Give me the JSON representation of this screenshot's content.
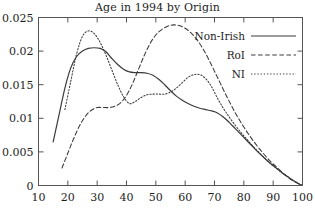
{
  "chart_data": {
    "type": "line",
    "title": "Age in 1994 by Origin",
    "xlabel": "",
    "ylabel": "",
    "xlim": [
      10,
      100
    ],
    "ylim": [
      0,
      0.025
    ],
    "grid": false,
    "legend_position": "top-right",
    "xticks": [
      10,
      20,
      30,
      40,
      50,
      60,
      70,
      80,
      90,
      100
    ],
    "xtick_labels": [
      "10",
      "20",
      "30",
      "40",
      "50",
      "60",
      "70",
      "80",
      "90",
      "100"
    ],
    "yticks": [
      0,
      0.005,
      0.01,
      0.015,
      0.02,
      0.025
    ],
    "ytick_labels": [
      "0",
      "0.005",
      "0.01",
      "0.015",
      "0.02",
      "0.025"
    ],
    "series": [
      {
        "name": "Non-Irish",
        "style": "solid",
        "color": "#3a3a3a",
        "x": [
          15,
          17,
          19,
          21,
          23,
          25,
          27,
          29,
          31,
          33,
          35,
          37,
          39,
          41,
          43,
          45,
          47,
          49,
          51,
          53,
          55,
          57,
          59,
          61,
          63,
          65,
          67,
          69,
          71,
          73,
          75,
          77,
          79,
          81,
          83,
          85,
          87,
          89,
          91,
          93,
          95,
          97,
          99,
          100
        ],
        "y": [
          0.0065,
          0.0105,
          0.0145,
          0.0175,
          0.0192,
          0.02,
          0.0204,
          0.0205,
          0.0204,
          0.0199,
          0.0189,
          0.018,
          0.0173,
          0.0169,
          0.0168,
          0.0168,
          0.0167,
          0.0164,
          0.0158,
          0.015,
          0.0141,
          0.0133,
          0.0127,
          0.0122,
          0.0118,
          0.0115,
          0.0113,
          0.0111,
          0.0108,
          0.0102,
          0.0094,
          0.0085,
          0.0076,
          0.0067,
          0.0058,
          0.0049,
          0.0041,
          0.0033,
          0.0026,
          0.0019,
          0.0013,
          0.0007,
          0.0002,
          0.0
        ]
      },
      {
        "name": "RoI",
        "style": "dashed",
        "color": "#3a3a3a",
        "x": [
          18,
          20,
          22,
          24,
          26,
          28,
          30,
          32,
          34,
          36,
          38,
          40,
          42,
          44,
          46,
          48,
          50,
          52,
          54,
          56,
          58,
          60,
          62,
          64,
          66,
          68,
          70,
          72,
          74,
          76,
          78,
          80,
          82,
          84,
          86,
          88,
          90,
          92,
          94,
          96,
          98,
          100
        ],
        "y": [
          0.0026,
          0.0048,
          0.007,
          0.0089,
          0.0103,
          0.0112,
          0.0116,
          0.0116,
          0.0116,
          0.0118,
          0.0123,
          0.0134,
          0.0151,
          0.0172,
          0.0193,
          0.0211,
          0.0224,
          0.0232,
          0.0237,
          0.0239,
          0.0238,
          0.0234,
          0.0227,
          0.0217,
          0.0204,
          0.0188,
          0.017,
          0.0152,
          0.0134,
          0.0117,
          0.0101,
          0.0087,
          0.0074,
          0.0062,
          0.0051,
          0.0041,
          0.0032,
          0.0024,
          0.0016,
          0.0009,
          0.0004,
          0.0
        ]
      },
      {
        "name": "NI",
        "style": "dotted",
        "color": "#3a3a3a",
        "x": [
          19,
          21,
          23,
          25,
          27,
          29,
          31,
          33,
          35,
          37,
          39,
          41,
          43,
          45,
          47,
          49,
          51,
          53,
          55,
          57,
          59,
          61,
          63,
          65,
          67,
          69,
          71,
          73,
          75,
          77,
          79,
          81,
          83,
          85,
          87,
          89,
          91,
          93,
          95,
          97,
          99,
          100
        ],
        "y": [
          0.0113,
          0.0155,
          0.0196,
          0.0222,
          0.023,
          0.0226,
          0.0213,
          0.0194,
          0.0172,
          0.015,
          0.0132,
          0.0122,
          0.0125,
          0.0131,
          0.0135,
          0.0136,
          0.0136,
          0.0136,
          0.0139,
          0.0145,
          0.0153,
          0.0161,
          0.0165,
          0.0165,
          0.0159,
          0.0147,
          0.013,
          0.0115,
          0.0102,
          0.009,
          0.0079,
          0.0069,
          0.0059,
          0.005,
          0.0041,
          0.0033,
          0.0026,
          0.0019,
          0.0013,
          0.0007,
          0.0002,
          0.0
        ]
      }
    ]
  },
  "legend": {
    "items": [
      {
        "label": "Non-Irish",
        "style": "solid"
      },
      {
        "label": "RoI",
        "style": "dashed"
      },
      {
        "label": "NI",
        "style": "dotted"
      }
    ]
  }
}
